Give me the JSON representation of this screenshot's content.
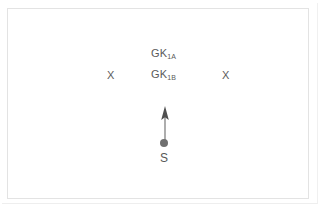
{
  "figure": {
    "type": "schematic-diagram",
    "background_color": "#ffffff",
    "frame_border_color": "#e3e3e3",
    "text_color": "#5a5a5a",
    "labels": [
      {
        "id": "gk1a",
        "base": "GK",
        "subscript": "1A",
        "x": 143,
        "y": 39
      },
      {
        "id": "gk1b",
        "base": "GK",
        "subscript": "1B",
        "x": 143,
        "y": 60
      }
    ],
    "markers": [
      {
        "id": "x-left",
        "glyph": "X",
        "x": 99,
        "y": 61
      },
      {
        "id": "x-right",
        "glyph": "X",
        "x": 214,
        "y": 61
      }
    ],
    "source": {
      "label": "S",
      "dot_color": "#6f6f6f",
      "dot_x": 156,
      "dot_y": 134,
      "label_x": 152,
      "label_y": 143
    },
    "arrow": {
      "direction": "up",
      "color": "#6b6b6b",
      "start_x": 157,
      "start_y": 130,
      "end_x": 157,
      "end_y": 99
    }
  }
}
